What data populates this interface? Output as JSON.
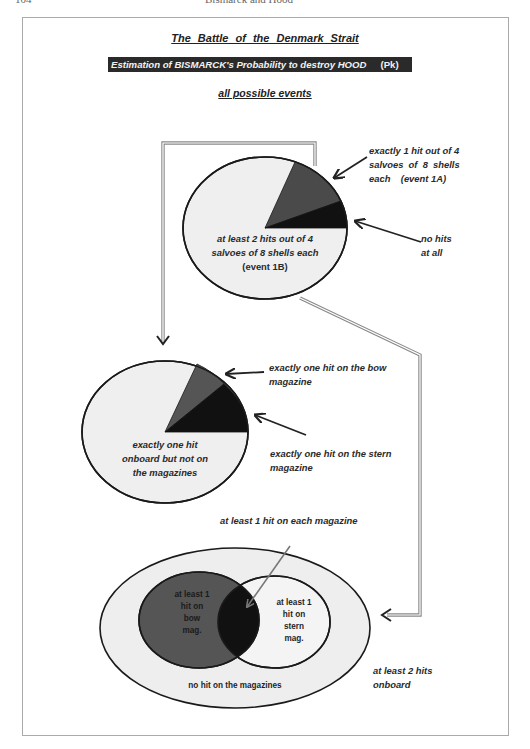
{
  "running_head": {
    "page_number": "104",
    "title": "Bismarck and Hood"
  },
  "header": {
    "title": "The  Battle  of  the  Denmark  Strait",
    "banner": "Estimation of BISMARCK's Probability to destroy HOOD",
    "banner_suffix": "(Pk)",
    "subtitle": "all possible events"
  },
  "pie1": {
    "slices": [
      {
        "name": "at least 2 hits out of 4 salvoes of 8 shells each (event 1B)",
        "color": "#efefef",
        "share_approx": 0.8
      },
      {
        "name": "exactly 1 hit out of 4 salvoes of 8 shells each (event 1A)",
        "color": "#4a4a4a",
        "share_approx": 0.15
      },
      {
        "name": "no hits at all",
        "color": "#111111",
        "share_approx": 0.05
      }
    ],
    "inner_label": [
      "at least 2 hits out of 4",
      "salvoes of 8 shells each",
      "(event 1B)"
    ],
    "callout_1A": [
      "exactly 1 hit out of 4",
      "salvoes  of  8  shells",
      "each    (event 1A)"
    ],
    "callout_none": [
      "no hits",
      "at all"
    ]
  },
  "pie2": {
    "slices": [
      {
        "name": "exactly one hit onboard but not on the magazines",
        "color": "#efefef",
        "share_approx": 0.82
      },
      {
        "name": "exactly one hit on the bow magazine",
        "color": "#555555",
        "share_approx": 0.07
      },
      {
        "name": "exactly one hit on the stern magazine",
        "color": "#111111",
        "share_approx": 0.11
      }
    ],
    "inner_label": [
      "exactly one hit",
      "onboard but not on",
      "the magazines"
    ],
    "callout_bow": [
      "exactly one hit on the bow",
      "magazine"
    ],
    "callout_stern": [
      "exactly one hit on the stern",
      "magazine"
    ]
  },
  "venn": {
    "outer_label": "no hit on the magazines",
    "outside_label": [
      "at least 2 hits",
      "onboard"
    ],
    "bow_label": [
      "at least 1",
      "hit on",
      "bow",
      "mag."
    ],
    "stern_label": [
      "at least 1",
      "hit on",
      "stern",
      "mag."
    ],
    "intersection_callout": "at least 1 hit on each magazine",
    "colors": {
      "outer": "#eeeeee",
      "bow": "#555555",
      "stern": "#f4f4f4",
      "intersection": "#111111"
    }
  }
}
